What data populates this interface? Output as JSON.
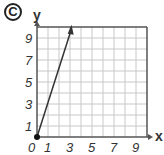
{
  "option_label": "C",
  "chart_data": {
    "type": "line",
    "title": "",
    "xlabel": "x",
    "ylabel": "y",
    "xlim": [
      0,
      10
    ],
    "ylim": [
      0,
      10
    ],
    "grid": true,
    "x_ticks": [
      "0",
      "1",
      "3",
      "5",
      "7",
      "9"
    ],
    "y_ticks": [
      "1",
      "3",
      "5",
      "7",
      "9"
    ],
    "series": [
      {
        "name": "line",
        "x": [
          0,
          1,
          2,
          3
        ],
        "y": [
          0,
          3,
          6,
          9
        ],
        "equation": "y = 3x",
        "start_point": [
          0,
          0
        ],
        "arrow_end": true
      }
    ],
    "colors": {
      "grid": "#c8c8c8",
      "axis": "#555555",
      "line": "#333333"
    }
  }
}
